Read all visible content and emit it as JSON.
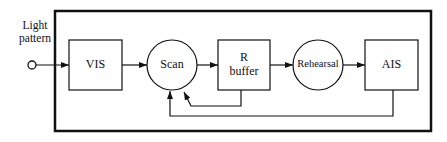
{
  "input": {
    "label_line1": "Light",
    "label_line2": "pattern"
  },
  "nodes": [
    {
      "id": "vis",
      "label": "VIS",
      "shape": "box"
    },
    {
      "id": "scan",
      "label": "Scan",
      "shape": "circle"
    },
    {
      "id": "rbuffer",
      "label_line1": "R",
      "label_line2": "buffer",
      "shape": "box"
    },
    {
      "id": "rehearsal",
      "label": "Rehearsal",
      "shape": "circle"
    },
    {
      "id": "ais",
      "label": "AIS",
      "shape": "box"
    }
  ],
  "edges": [
    {
      "from": "input",
      "to": "vis"
    },
    {
      "from": "vis",
      "to": "scan"
    },
    {
      "from": "scan",
      "to": "rbuffer"
    },
    {
      "from": "rbuffer",
      "to": "rehearsal"
    },
    {
      "from": "rehearsal",
      "to": "ais"
    },
    {
      "from": "rbuffer",
      "to": "scan",
      "type": "feedback"
    },
    {
      "from": "ais",
      "to": "scan",
      "type": "feedback"
    }
  ]
}
